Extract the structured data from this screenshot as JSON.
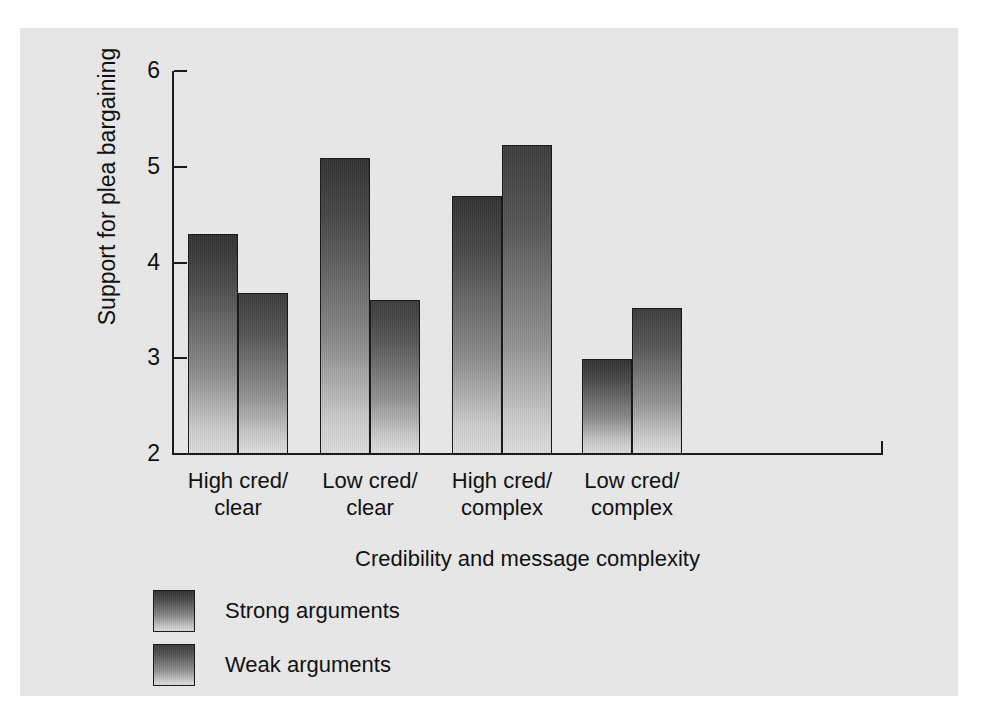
{
  "chart_data": {
    "type": "bar",
    "title": "",
    "xlabel": "Credibility and message complexity",
    "ylabel": "Support for plea bargaining",
    "categories": [
      "High cred/\nclear",
      "Low cred/\nclear",
      "High cred/\ncomplex",
      "Low cred/\ncomplex"
    ],
    "series": [
      {
        "name": "Strong arguments",
        "values": [
          4.3,
          5.09,
          4.69,
          2.99
        ]
      },
      {
        "name": "Weak arguments",
        "values": [
          3.68,
          3.61,
          5.23,
          3.53
        ]
      }
    ],
    "ylim": [
      2,
      6
    ],
    "yticks": [
      2,
      3,
      4,
      5,
      6
    ],
    "ytick_labels": [
      "2",
      "3",
      "4",
      "5",
      "6"
    ],
    "grid": false,
    "legend_position": "bottom-left",
    "colors": {
      "strong_top": "#323232",
      "strong_bottom": "#dcdcdc",
      "weak_top": "#3c3c3c",
      "weak_bottom": "#dedede",
      "axis": "#1c1c1c",
      "panel_background": "#e9e9e9",
      "page_background": "#ffffff",
      "text": "#111111"
    }
  }
}
